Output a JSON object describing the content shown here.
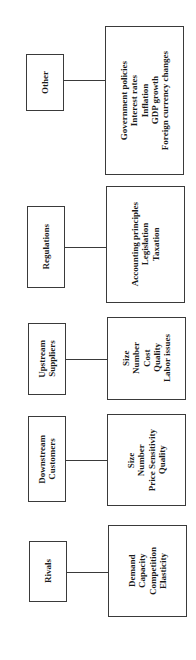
{
  "diagram": {
    "orientation": "rotated-90-ccw",
    "categories": [
      {
        "id": "other",
        "label_lines": [
          "Other"
        ],
        "details": [
          "Government policies",
          "Interest rates",
          "Inflation",
          "GDP growth",
          "Foreign currency changes"
        ]
      },
      {
        "id": "regulations",
        "label_lines": [
          "Regulations"
        ],
        "details": [
          "Accounting principles",
          "Legislation",
          "Taxation"
        ]
      },
      {
        "id": "upstream-suppliers",
        "label_lines": [
          "Upstream",
          "Suppliers"
        ],
        "details": [
          "Size",
          "Number",
          "Cost",
          "Quality",
          "Labor issues"
        ]
      },
      {
        "id": "downstream-customers",
        "label_lines": [
          "Downstream",
          "Customers"
        ],
        "details": [
          "Size",
          "Number",
          "Price Sensitivity",
          "Quality"
        ]
      },
      {
        "id": "rivals",
        "label_lines": [
          "Rivals"
        ],
        "details": [
          "Demand",
          "Capacity",
          "Competition",
          "Elasticity"
        ]
      }
    ],
    "colors": {
      "stroke": "#3a3a3a",
      "text": "#1a1a1a",
      "background": "#ffffff"
    }
  }
}
